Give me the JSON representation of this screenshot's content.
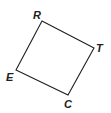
{
  "figure": {
    "type": "quadrilateral",
    "name": "RTCE",
    "stroke_color": "#231f20",
    "vertices": [
      {
        "label": "R",
        "x": 42,
        "y": 21
      },
      {
        "label": "T",
        "x": 94,
        "y": 48
      },
      {
        "label": "C",
        "x": 68,
        "y": 95
      },
      {
        "label": "E",
        "x": 16,
        "y": 70
      }
    ]
  },
  "labels": {
    "R": "R",
    "T": "T",
    "C": "C",
    "E": "E"
  }
}
